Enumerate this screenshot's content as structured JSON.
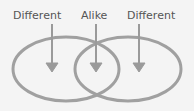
{
  "diagram": {
    "type": "venn",
    "labels": {
      "left": "Different",
      "middle": "Alike",
      "right": "Different"
    },
    "colors": {
      "stroke": "#9a9a9a",
      "text": "#555555",
      "background": "#f4f4f4"
    }
  }
}
